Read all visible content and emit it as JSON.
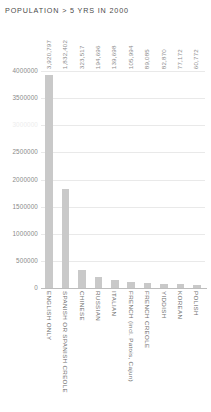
{
  "chart_data": {
    "type": "bar",
    "title": "POPULATION > 5 YRS IN 2000",
    "xlabel": "",
    "ylabel": "",
    "ylim": [
      0,
      4000000
    ],
    "grid": true,
    "legend": "none",
    "orientation": "vertical",
    "bar_color": "#c9c9c9",
    "categories": [
      "ENGLISH ONLY",
      "SPANISH OR SPANISH CREOLE",
      "CHINESE",
      "RUSSIAN",
      "ITALIAN",
      "FRENCH (incl. Patois, Cajun)",
      "FRENCH CREOLE",
      "YIDDISH",
      "KOREAN",
      "POLISH"
    ],
    "values": [
      3920797,
      1832402,
      323517,
      194696,
      139698,
      105994,
      89085,
      82870,
      77172,
      60772
    ],
    "value_labels": [
      "3,920,797",
      "1,832,402",
      "323,517",
      "194,696",
      "139,698",
      "105,994",
      "89,085",
      "82,870",
      "77,172",
      "60,772"
    ],
    "yticks": [
      4000000,
      3500000,
      3000000,
      2500000,
      2000000,
      1500000,
      1000000,
      500000,
      0
    ],
    "ytick_labels": [
      "4000000",
      "3500000",
      "3000000",
      "2500000",
      "2000000",
      "1500000",
      "1000000",
      "500000",
      "0"
    ],
    "ytick_faint_index": 2
  }
}
